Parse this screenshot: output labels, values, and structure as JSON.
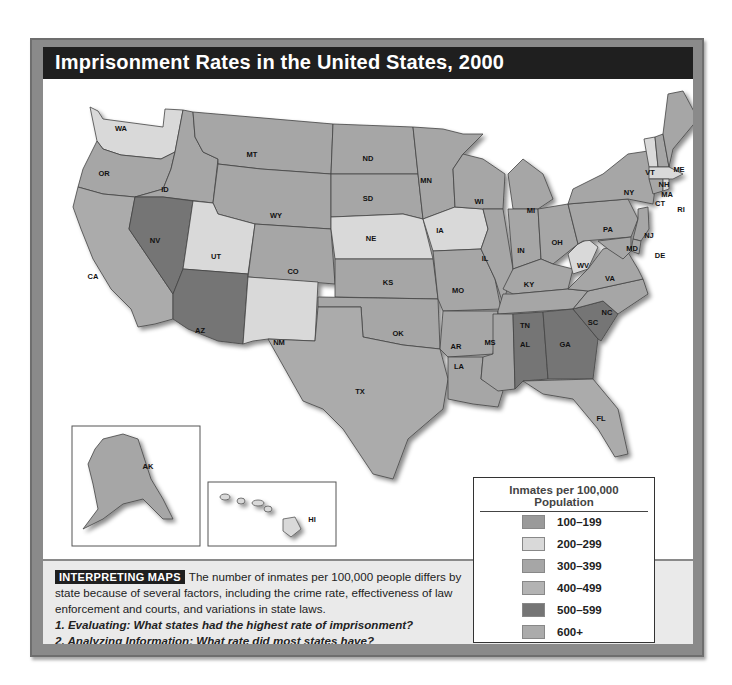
{
  "title": "Imprisonment Rates in the United States, 2000",
  "legend": {
    "title": "Inmates per 100,000 Population",
    "items": [
      {
        "label": "100–199",
        "color": "#9a9a9a"
      },
      {
        "label": "200–299",
        "color": "#d9d9d9"
      },
      {
        "label": "300–399",
        "color": "#a6a6a6"
      },
      {
        "label": "400–499",
        "color": "#b3b3b3"
      },
      {
        "label": "500–599",
        "color": "#757575"
      },
      {
        "label": "600+",
        "color": "#ababab"
      }
    ]
  },
  "caption": {
    "badge": "INTERPRETING MAPS",
    "text": "The number of inmates per 100,000 people differs by state because of several factors, including the crime rate, effectiveness of law enforcement and courts, and variations in state laws.",
    "question1": "1. Evaluating: What states had the highest rate of imprisonment?",
    "question2": "2. Analyzing Information: What rate did most states have?"
  },
  "states": {
    "WA": "WA",
    "OR": "OR",
    "CA": "CA",
    "ID": "ID",
    "NV": "NV",
    "MT": "MT",
    "WY": "WY",
    "UT": "UT",
    "AZ": "AZ",
    "CO": "CO",
    "NM": "NM",
    "ND": "ND",
    "SD": "SD",
    "NE": "NE",
    "KS": "KS",
    "OK": "OK",
    "TX": "TX",
    "MN": "MN",
    "IA": "IA",
    "MO": "MO",
    "AR": "AR",
    "LA": "LA",
    "WI": "WI",
    "IL": "IL",
    "MS": "MS",
    "MI": "MI",
    "IN": "IN",
    "KY": "KY",
    "TN": "TN",
    "AL": "AL",
    "OH": "OH",
    "WV": "WV",
    "VA": "VA",
    "NC": "NC",
    "SC": "SC",
    "GA": "GA",
    "FL": "FL",
    "PA": "PA",
    "NY": "NY",
    "VT": "VT",
    "NH": "NH",
    "ME": "ME",
    "MA": "MA",
    "CT": "CT",
    "RI": "RI",
    "NJ": "NJ",
    "DE": "DE",
    "MD": "MD",
    "AK": "AK",
    "HI": "HI"
  }
}
